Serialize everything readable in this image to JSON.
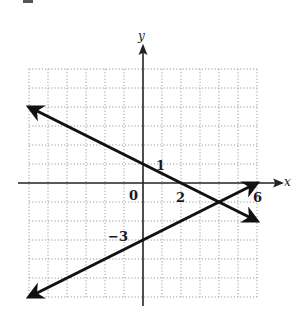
{
  "chart_data": {
    "type": "line",
    "title": "",
    "xlabel": "x",
    "ylabel": "y",
    "xlim": [
      -6,
      6
    ],
    "ylim": [
      -6,
      6
    ],
    "grid": true,
    "grid_style": "dotted",
    "tick_labels": {
      "origin": "0",
      "x_ticks": [
        "2",
        "6"
      ],
      "y_ticks": [
        "1",
        "-3"
      ]
    },
    "series": [
      {
        "name": "line-1",
        "equation": "y = -x/2 + 1",
        "points": [
          [
            -6,
            4
          ],
          [
            0,
            1
          ],
          [
            2,
            0
          ],
          [
            4,
            -1
          ],
          [
            6,
            -2
          ]
        ],
        "arrows": "both",
        "annotated_intercepts": {
          "y_intercept": 1,
          "x_intercept": 2
        }
      },
      {
        "name": "line-2",
        "equation": "y = x/2 - 3",
        "points": [
          [
            -6,
            -6
          ],
          [
            0,
            -3
          ],
          [
            4,
            -1
          ],
          [
            6,
            0
          ]
        ],
        "arrows": "both",
        "annotated_intercepts": {
          "y_intercept": -3,
          "x_intercept": 6
        }
      }
    ],
    "intersection": [
      4,
      -1
    ],
    "legend": null
  },
  "labels": {
    "y_axis": "y",
    "x_axis": "x",
    "origin": "0",
    "one": "1",
    "two": "2",
    "six": "6",
    "neg_three": "−3"
  },
  "colors": {
    "grid": "#9a9a9a",
    "axis": "#222222",
    "line": "#111111"
  }
}
